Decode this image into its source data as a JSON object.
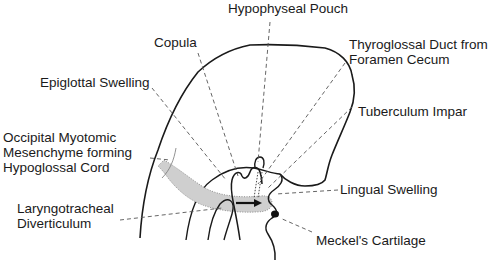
{
  "figure": {
    "type": "embryology-diagram",
    "line_color": "#1a1a1a",
    "leader_color": "#555555",
    "stipple_color": "#bdbdbd"
  },
  "labels": {
    "hypophyseal_pouch": "Hypophyseal Pouch",
    "copula": "Copula",
    "thyroglossal_line1": "Thyroglossal Duct from",
    "thyroglossal_line2": "Foramen Cecum",
    "epiglottal_swelling": "Epiglottal Swelling",
    "tuberculum_impar": "Tuberculum Impar",
    "occipital_line1": "Occipital Myotomic",
    "occipital_line2": "Mesenchyme forming",
    "occipital_line3": "Hypoglossal Cord",
    "lingual_swelling": "Lingual Swelling",
    "laryngotracheal_line1": "Laryngotracheal",
    "laryngotracheal_line2": "Diverticulum",
    "meckels_cartilage": "Meckel's Cartilage"
  }
}
